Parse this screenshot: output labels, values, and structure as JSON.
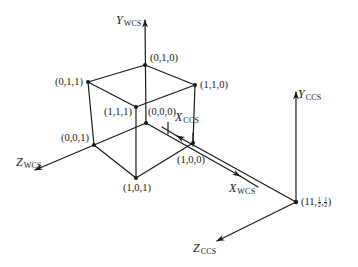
{
  "diagram": {
    "type": "coordinate-systems",
    "wcs_axes": {
      "y": {
        "letter": "Y",
        "subscript": "WCS"
      },
      "x": {
        "letter": "X",
        "subscript": "WCS"
      },
      "z": {
        "letter": "Z",
        "subscript": "WCS"
      }
    },
    "ccs_axes": {
      "y": {
        "letter": "Y",
        "subscript": "CCS"
      },
      "x": {
        "letter": "X",
        "subscript": "CCS"
      },
      "z": {
        "letter": "Z",
        "subscript": "CCS"
      }
    },
    "vertices": {
      "v010": "(0,1,0)",
      "v011": "(0,1,1)",
      "v110": "(1,1,0)",
      "v111": "(1,1,1)",
      "v000": "(0,0,0)",
      "v001": "(0,0,1)",
      "v101": "(1,0,1)",
      "v100": "(1,0,0)"
    },
    "camera_origin": {
      "prefix": "(11,",
      "frac1_num": "1",
      "frac1_den": "2",
      "sep": ",",
      "frac2_num": "1",
      "frac2_den": "2",
      "suffix": ")"
    },
    "colors": {
      "line": "#1a1a1a",
      "background": "#ffffff"
    }
  }
}
